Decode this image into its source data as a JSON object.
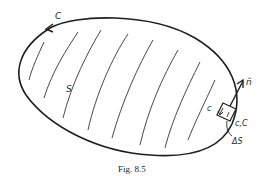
{
  "figure": {
    "caption": "Fig. 8.5",
    "labels": {
      "boundary_curve": "C",
      "surface": "S",
      "normal": "n̂",
      "element_edge": "c",
      "element_edge_boundary": "c,C",
      "area_element": "ΔS"
    },
    "colors": {
      "stroke": "#1e1e1e",
      "background": "#ffffff"
    }
  }
}
